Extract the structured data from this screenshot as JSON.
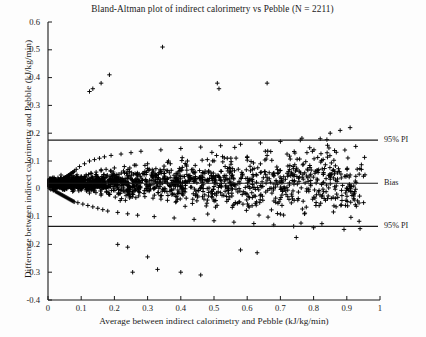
{
  "figure": {
    "background_color": "#fdfdfd",
    "foreground_color": "#1a1a1a"
  },
  "chart_data": {
    "type": "scatter",
    "title": "Bland-Altman plot of indirect calorimetry vs Pebble (N = 2211)",
    "xlabel": "Average between indirect calorimetry and Pebble (kJ/kg/min)",
    "ylabel": "Difference between indirect calorimetry and Pebble (kJ/kg/min)",
    "xlim": [
      0,
      1
    ],
    "ylim": [
      -0.4,
      0.6
    ],
    "xticks": [
      "0",
      "0.1",
      "0.2",
      "0.3",
      "0.4",
      "0.5",
      "0.6",
      "0.7",
      "0.8",
      "0.9",
      "1"
    ],
    "xtick_values": [
      0,
      0.1,
      0.2,
      0.3,
      0.4,
      0.5,
      0.6,
      0.7,
      0.8,
      0.9,
      1
    ],
    "yticks": [
      "0.6",
      "0.5",
      "0.4",
      "0.3",
      "0.2",
      "0.1",
      "0",
      "-0.1",
      "-0.2",
      "-0.3",
      "-0.4"
    ],
    "ytick_values": [
      0.6,
      0.5,
      0.4,
      0.3,
      0.2,
      0.1,
      0,
      -0.1,
      -0.2,
      -0.3,
      -0.4
    ],
    "grid": false,
    "legend": "none",
    "marker": "plus",
    "marker_color": "#000000",
    "n_points": 2211,
    "reference_lines": [
      {
        "name": "upper-pi",
        "label": "95% PI",
        "value": 0.175,
        "style": "solid"
      },
      {
        "name": "bias",
        "label": "Bias",
        "value": 0.02,
        "style": "solid"
      },
      {
        "name": "lower-pi",
        "label": "95% PI",
        "value": -0.135,
        "style": "solid"
      }
    ],
    "annotations": [
      {
        "text": "95% PI",
        "at_y": 0.175
      },
      {
        "text": "Bias",
        "at_y": 0.02
      },
      {
        "text": "95% PI",
        "at_y": -0.135
      }
    ],
    "points": [
      [
        0.012,
        0.004
      ],
      [
        0.013,
        -0.002
      ],
      [
        0.014,
        0.009
      ],
      [
        0.015,
        0.001
      ],
      [
        0.016,
        -0.006
      ],
      [
        0.017,
        0.012
      ],
      [
        0.018,
        0.002
      ],
      [
        0.019,
        -0.004
      ],
      [
        0.02,
        0.014
      ],
      [
        0.021,
        0.006
      ],
      [
        0.022,
        -0.009
      ],
      [
        0.023,
        0.017
      ],
      [
        0.024,
        0.003
      ],
      [
        0.025,
        -0.011
      ],
      [
        0.026,
        0.019
      ],
      [
        0.027,
        0.007
      ],
      [
        0.028,
        -0.013
      ],
      [
        0.029,
        0.021
      ],
      [
        0.03,
        0.005
      ],
      [
        0.031,
        -0.015
      ],
      [
        0.032,
        0.024
      ],
      [
        0.033,
        0.008
      ],
      [
        0.034,
        -0.017
      ],
      [
        0.035,
        0.026
      ],
      [
        0.036,
        0.01
      ],
      [
        0.037,
        -0.019
      ],
      [
        0.038,
        0.029
      ],
      [
        0.039,
        0.012
      ],
      [
        0.04,
        -0.021
      ],
      [
        0.041,
        0.031
      ],
      [
        0.042,
        0.014
      ],
      [
        0.043,
        -0.023
      ],
      [
        0.044,
        0.034
      ],
      [
        0.045,
        0.016
      ],
      [
        0.046,
        -0.025
      ],
      [
        0.047,
        0.036
      ],
      [
        0.048,
        0.018
      ],
      [
        0.049,
        -0.027
      ],
      [
        0.05,
        0.039
      ],
      [
        0.051,
        0.02
      ],
      [
        0.052,
        -0.029
      ],
      [
        0.053,
        0.041
      ],
      [
        0.054,
        0.022
      ],
      [
        0.055,
        -0.031
      ],
      [
        0.056,
        0.044
      ],
      [
        0.057,
        0.024
      ],
      [
        0.058,
        -0.033
      ],
      [
        0.059,
        0.046
      ],
      [
        0.06,
        0.026
      ],
      [
        0.061,
        -0.035
      ],
      [
        0.062,
        0.049
      ],
      [
        0.063,
        0.028
      ],
      [
        0.064,
        -0.037
      ],
      [
        0.065,
        0.051
      ],
      [
        0.066,
        0.03
      ],
      [
        0.067,
        -0.039
      ],
      [
        0.068,
        0.054
      ],
      [
        0.069,
        0.032
      ],
      [
        0.07,
        -0.041
      ],
      [
        0.071,
        0.056
      ],
      [
        0.072,
        0.034
      ],
      [
        0.073,
        -0.043
      ],
      [
        0.074,
        0.059
      ],
      [
        0.075,
        0.036
      ],
      [
        0.076,
        -0.045
      ],
      [
        0.077,
        0.061
      ],
      [
        0.078,
        0.038
      ],
      [
        0.079,
        -0.047
      ],
      [
        0.08,
        0.064
      ],
      [
        0.081,
        0.04
      ],
      [
        0.085,
        0.07
      ],
      [
        0.09,
        -0.05
      ],
      [
        0.095,
        0.08
      ],
      [
        0.1,
        0.045
      ],
      [
        0.105,
        -0.055
      ],
      [
        0.11,
        0.09
      ],
      [
        0.115,
        0.05
      ],
      [
        0.12,
        -0.06
      ],
      [
        0.125,
        0.1
      ],
      [
        0.13,
        0.055
      ],
      [
        0.135,
        -0.065
      ],
      [
        0.14,
        0.105
      ],
      [
        0.145,
        0.06
      ],
      [
        0.15,
        -0.07
      ],
      [
        0.155,
        0.11
      ],
      [
        0.16,
        0.065
      ],
      [
        0.165,
        -0.075
      ],
      [
        0.17,
        0.115
      ],
      [
        0.175,
        0.07
      ],
      [
        0.18,
        -0.08
      ],
      [
        0.19,
        0.12
      ],
      [
        0.2,
        0.075
      ],
      [
        0.21,
        -0.085
      ],
      [
        0.22,
        0.125
      ],
      [
        0.23,
        0.08
      ],
      [
        0.24,
        -0.09
      ],
      [
        0.25,
        0.13
      ],
      [
        0.26,
        0.085
      ],
      [
        0.27,
        -0.095
      ],
      [
        0.28,
        0.135
      ],
      [
        0.3,
        0.09
      ],
      [
        0.32,
        -0.1
      ],
      [
        0.34,
        0.14
      ],
      [
        0.36,
        0.095
      ],
      [
        0.38,
        -0.105
      ],
      [
        0.4,
        0.145
      ],
      [
        0.42,
        0.1
      ],
      [
        0.44,
        -0.11
      ],
      [
        0.46,
        0.15
      ],
      [
        0.48,
        0.105
      ],
      [
        0.5,
        -0.115
      ],
      [
        0.52,
        0.155
      ],
      [
        0.54,
        0.11
      ],
      [
        0.56,
        -0.12
      ],
      [
        0.58,
        0.16
      ],
      [
        0.6,
        0.115
      ],
      [
        0.62,
        -0.125
      ],
      [
        0.64,
        0.165
      ],
      [
        0.66,
        0.12
      ],
      [
        0.68,
        -0.13
      ],
      [
        0.7,
        0.17
      ],
      [
        0.72,
        0.125
      ],
      [
        0.74,
        -0.135
      ],
      [
        0.76,
        0.175
      ],
      [
        0.78,
        0.13
      ],
      [
        0.8,
        -0.14
      ],
      [
        0.82,
        0.18
      ],
      [
        0.85,
        0.2
      ],
      [
        0.88,
        0.21
      ],
      [
        0.91,
        0.22
      ],
      [
        0.345,
        0.51
      ],
      [
        0.185,
        0.41
      ],
      [
        0.16,
        0.38
      ],
      [
        0.135,
        0.36
      ],
      [
        0.125,
        0.35
      ],
      [
        0.51,
        0.38
      ],
      [
        0.515,
        0.36
      ],
      [
        0.66,
        0.38
      ],
      [
        0.3,
        -0.245
      ],
      [
        0.33,
        -0.29
      ],
      [
        0.255,
        -0.3
      ],
      [
        0.4,
        -0.3
      ],
      [
        0.24,
        -0.21
      ],
      [
        0.21,
        -0.2
      ],
      [
        0.58,
        -0.22
      ],
      [
        0.63,
        -0.23
      ],
      [
        0.46,
        -0.31
      ]
    ]
  },
  "axes": {
    "x_tick_labels": [
      "0",
      "0.1",
      "0.2",
      "0.3",
      "0.4",
      "0.5",
      "0.6",
      "0.7",
      "0.8",
      "0.9",
      "1"
    ],
    "y_tick_labels": [
      "0.6",
      "0.5",
      "0.4",
      "0.3",
      "0.2",
      "0.1",
      "0",
      "-0.1",
      "-0.2",
      "-0.3",
      "-0.4"
    ]
  }
}
